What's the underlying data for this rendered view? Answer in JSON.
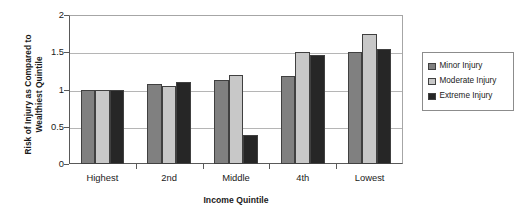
{
  "chart_data": {
    "type": "bar",
    "title": "",
    "xlabel": "Income Quintile",
    "ylabel": "Risk of Injury as Compared to\nWealthiest Quintile",
    "categories": [
      "Highest",
      "2nd",
      "Middle",
      "4th",
      "Lowest"
    ],
    "series": [
      {
        "name": "Minor Injury",
        "color": "#808080",
        "values": [
          1.0,
          1.07,
          1.13,
          1.18,
          1.5
        ]
      },
      {
        "name": "Moderate Injury",
        "color": "#c8c8c8",
        "values": [
          1.0,
          1.05,
          1.2,
          1.5,
          1.75
        ]
      },
      {
        "name": "Extreme Injury",
        "color": "#262626",
        "values": [
          1.0,
          1.1,
          0.39,
          1.46,
          1.54
        ]
      }
    ],
    "ylim": [
      0,
      2
    ],
    "yticks": [
      "0",
      "0.5",
      "1",
      "1.5",
      "2"
    ],
    "ytick_values": [
      0,
      0.5,
      1,
      1.5,
      2
    ],
    "grid": true,
    "legend_position": "right",
    "bar_border_color": "#404040",
    "axis_color": "#595959",
    "gridline_color": "#b5b5b5",
    "background_color": "#ffffff"
  }
}
